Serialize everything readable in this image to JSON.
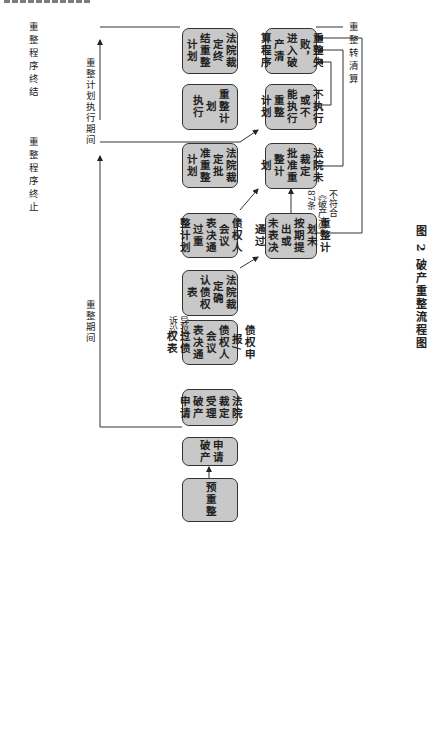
{
  "caption": "图 2  破产重整流程图",
  "main_flow": [
    {
      "id": "pre",
      "label": "预重整"
    },
    {
      "id": "apply",
      "label": "申请\n破产"
    },
    {
      "id": "accept",
      "label": "法院裁定\n受理破产\n申请"
    },
    {
      "id": "claims",
      "label": "债权申报/\n债权人会议\n表决通过债\n权表"
    },
    {
      "id": "confirm",
      "label": "法院裁定确\n认债权表"
    },
    {
      "id": "vote",
      "label": "债权人会议\n表决通过重\n整计划"
    },
    {
      "id": "approve",
      "label": "法院裁定批\n准重整计划"
    },
    {
      "id": "execute",
      "label": "重整计划\n执行"
    },
    {
      "id": "end",
      "label": "法院裁定终\n结重整计划"
    }
  ],
  "failure_flow": [
    {
      "id": "not_passed",
      "label": "重整计划未\n按期提出或\n未表决通过"
    },
    {
      "id": "not_approved",
      "label": "法院未裁定\n批准重整计\n划"
    },
    {
      "id": "not_executed",
      "label": "不执行或不\n能执行重整\n计划"
    },
    {
      "id": "liquidation",
      "label": "重整失败，\n进入破产清\n算程序"
    }
  ],
  "annotations": {
    "objection": "异议/\n诉讼",
    "non_compliance": "不符合\n《破产法》\n87条"
  },
  "milestones": {
    "reorg_end": "重整程序终结",
    "reorg_stop": "重整程序终止",
    "to_liquidation": "重整转清算"
  },
  "periods": {
    "reorg_period": "重整期间",
    "plan_exec_period": "重整计划执行期间"
  }
}
